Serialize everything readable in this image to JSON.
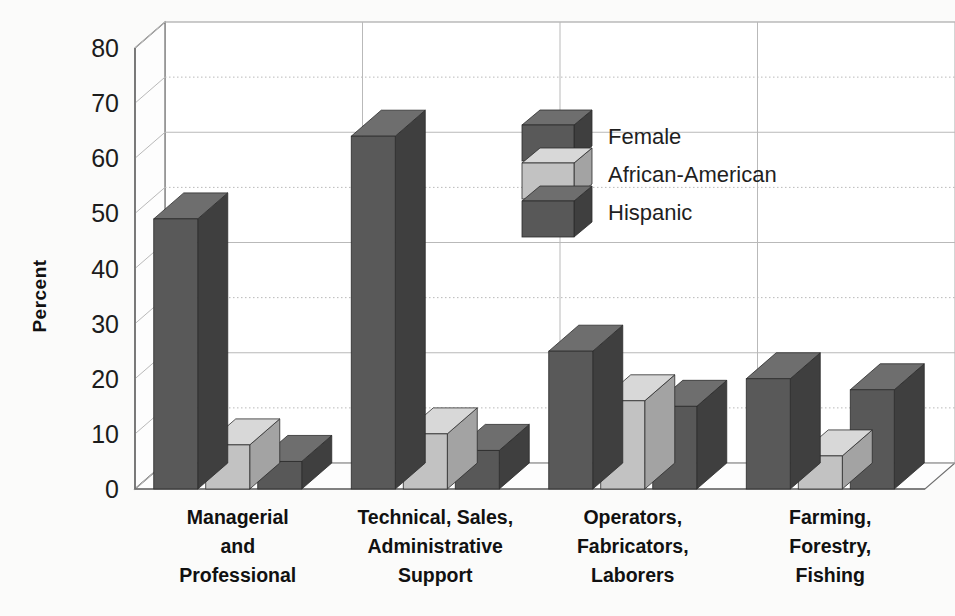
{
  "chart_data": {
    "type": "bar",
    "title": "",
    "subtitle": "",
    "xlabel": "",
    "ylabel": "Percent",
    "ylim": [
      0,
      80
    ],
    "ytick_step": 10,
    "yticks": [
      "80",
      "70",
      "60",
      "50",
      "40",
      "30",
      "20",
      "10",
      "0"
    ],
    "grid": true,
    "three_d": true,
    "legend_position": "inside-upper-center-right",
    "categories": [
      "Managerial and Professional",
      "Technical, Sales, Administrative Support",
      "Operators, Fabricators, Laborers",
      "Farming, Forestry, Fishing"
    ],
    "category_label_lines": [
      [
        "Managerial",
        "and",
        "Professional"
      ],
      [
        "Technical, Sales,",
        "Administrative",
        "Support"
      ],
      [
        "Operators,",
        "Fabricators,",
        "Laborers"
      ],
      [
        "Farming,",
        "Forestry,",
        "Fishing"
      ]
    ],
    "series": [
      {
        "name": "Female",
        "values": [
          49,
          64,
          25,
          20
        ],
        "color": "#595959",
        "color_top": "#6e6e6e",
        "color_side": "#3f3f3f"
      },
      {
        "name": "African-American",
        "values": [
          8,
          10,
          16,
          6
        ],
        "color": "#c2c2c2",
        "color_top": "#d8d8d8",
        "color_side": "#a3a3a3"
      },
      {
        "name": "Hispanic",
        "values": [
          5,
          7,
          15,
          18
        ],
        "color": "#585858",
        "color_top": "#6e6e6e",
        "color_side": "#3f3f3f"
      }
    ]
  },
  "axis": {
    "y_title": "Percent",
    "y_ticks": [
      "80",
      "70",
      "60",
      "50",
      "40",
      "30",
      "20",
      "10",
      "0"
    ]
  },
  "legend": {
    "items": [
      {
        "label": "Female"
      },
      {
        "label": "African-American"
      },
      {
        "label": "Hispanic"
      }
    ]
  },
  "colors": {
    "background": "#fbfbfa",
    "plot_background": "#ffffff",
    "gridline": "#b9b9b9",
    "axis_line": "#6f6f6f",
    "text": "#111111",
    "dark_bar_front": "#595959",
    "dark_bar_top": "#6e6e6e",
    "dark_bar_side": "#3f3f3f",
    "light_bar_front": "#c2c2c2",
    "light_bar_top": "#d8d8d8",
    "light_bar_side": "#a3a3a3"
  }
}
